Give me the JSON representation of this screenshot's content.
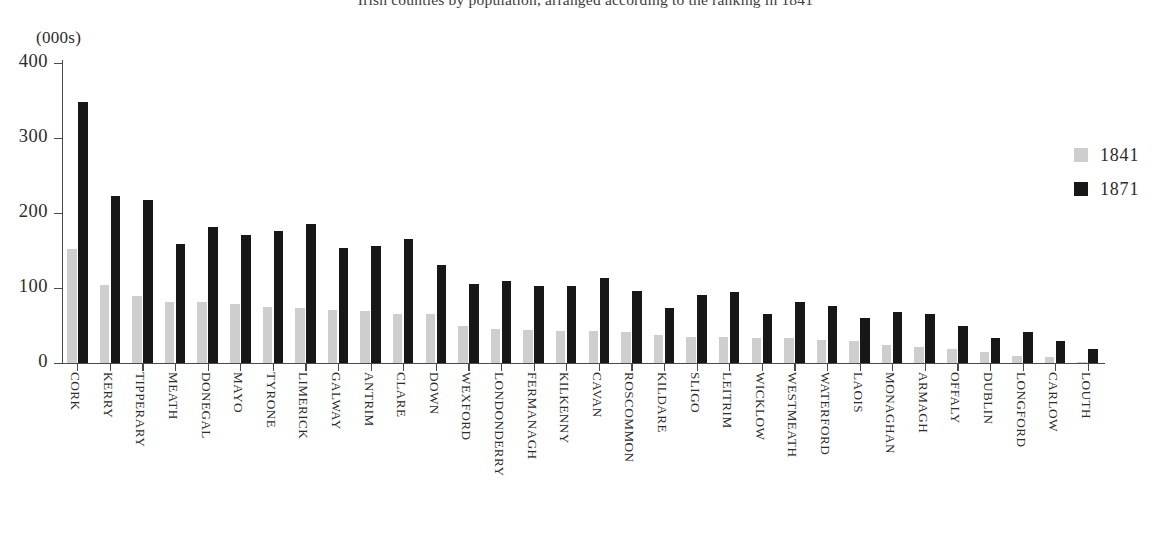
{
  "chart_data": {
    "type": "bar",
    "title": "Irish counties by population, arranged according to the ranking in 1841",
    "unit_label": "(000s)",
    "xlabel": "",
    "ylabel": "",
    "ylim": [
      0,
      400
    ],
    "yticks": [
      0,
      100,
      200,
      300,
      400
    ],
    "ytick_labels": [
      "0",
      "100",
      "200",
      "300",
      "400"
    ],
    "grid": false,
    "legend_position": "right",
    "categories": [
      "CORK",
      "KERRY",
      "TIPPERARY",
      "MEATH",
      "DONEGAL",
      "MAYO",
      "TYRONE",
      "LIMERICK",
      "GALWAY",
      "ANTRIM",
      "CLARE",
      "DOWN",
      "WEXFORD",
      "LONDONDERRY",
      "FERMANAGH",
      "KILKENNY",
      "CAVAN",
      "ROSCOMMON",
      "KILDARE",
      "SLIGO",
      "LEITRIM",
      "WICKLOW",
      "WESTMEATH",
      "WATERFORD",
      "LAOIS",
      "MONAGHAN",
      "ARMAGH",
      "OFFALY",
      "DUBLIN",
      "LONGFORD",
      "CARLOW",
      "LOUTH"
    ],
    "series": [
      {
        "name": "1841",
        "color": "#cecece",
        "values": [
          152,
          104,
          89,
          82,
          81,
          79,
          75,
          74,
          71,
          70,
          66,
          65,
          50,
          45,
          44,
          43,
          43,
          41,
          38,
          35,
          35,
          33,
          33,
          31,
          30,
          24,
          21,
          19,
          15,
          10,
          8,
          2
        ]
      },
      {
        "name": "1871",
        "color": "#171717",
        "values": [
          348,
          223,
          217,
          159,
          181,
          171,
          176,
          186,
          153,
          156,
          165,
          131,
          105,
          109,
          103,
          103,
          114,
          96,
          73,
          91,
          95,
          65,
          82,
          76,
          60,
          68,
          66,
          50,
          33,
          42,
          30,
          19
        ]
      }
    ]
  },
  "legend": {
    "items": [
      {
        "label": "1841",
        "swatch": "light-gray-swatch"
      },
      {
        "label": "1871",
        "swatch": "black-swatch"
      }
    ]
  }
}
